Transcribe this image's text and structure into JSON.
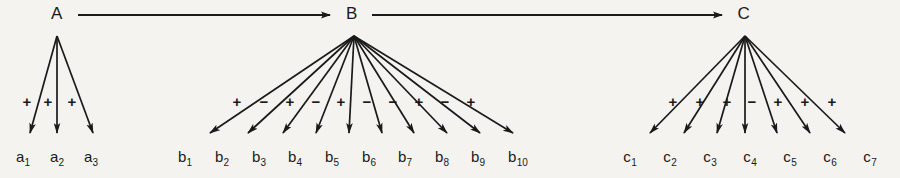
{
  "figure": {
    "background_color": "#f4f3ef",
    "ink_color": "#1a1a1a",
    "width": 900,
    "height": 178
  },
  "chain": {
    "arrow_glyph": "arrow-right",
    "nodes": [
      {
        "id": "A",
        "label": "A",
        "x": 57,
        "y": 14
      },
      {
        "id": "B",
        "label": "B",
        "x": 352,
        "y": 14
      },
      {
        "id": "C",
        "label": "C",
        "x": 744,
        "y": 14
      }
    ],
    "links": [
      {
        "from": "A",
        "to": "B",
        "x1": 78,
        "y1": 15,
        "x2": 330,
        "y2": 15
      },
      {
        "from": "B",
        "to": "C",
        "x1": 372,
        "y1": 15,
        "x2": 722,
        "y2": 15
      }
    ]
  },
  "groups": [
    {
      "id": "group-a",
      "parent": "A",
      "apex_x": 57,
      "apex_y": 36,
      "sign_y": 101,
      "tip_y": 133,
      "label_y": 158,
      "children": [
        {
          "label": "a",
          "index": "1",
          "sign": "+",
          "tip_x": 30,
          "label_x": 23,
          "sign_x": 27
        },
        {
          "label": "a",
          "index": "2",
          "sign": "+",
          "tip_x": 57,
          "label_x": 57,
          "sign_x": 48
        },
        {
          "label": "a",
          "index": "3",
          "sign": "+",
          "tip_x": 93,
          "label_x": 91,
          "sign_x": 72
        }
      ]
    },
    {
      "id": "group-b",
      "parent": "B",
      "apex_x": 354,
      "apex_y": 36,
      "sign_y": 101,
      "tip_y": 133,
      "label_y": 158,
      "children": [
        {
          "label": "b",
          "index": "1",
          "sign": "+",
          "tip_x": 210,
          "label_x": 185,
          "sign_x": 237
        },
        {
          "label": "b",
          "index": "2",
          "sign": "−",
          "tip_x": 248,
          "label_x": 222,
          "sign_x": 264
        },
        {
          "label": "b",
          "index": "3",
          "sign": "+",
          "tip_x": 283,
          "label_x": 259,
          "sign_x": 290
        },
        {
          "label": "b",
          "index": "4",
          "sign": "−",
          "tip_x": 316,
          "label_x": 295,
          "sign_x": 316
        },
        {
          "label": "b",
          "index": "5",
          "sign": "+",
          "tip_x": 349,
          "label_x": 332,
          "sign_x": 341
        },
        {
          "label": "b",
          "index": "6",
          "sign": "−",
          "tip_x": 382,
          "label_x": 369,
          "sign_x": 367
        },
        {
          "label": "b",
          "index": "7",
          "sign": "−",
          "tip_x": 414,
          "label_x": 405,
          "sign_x": 393
        },
        {
          "label": "b",
          "index": "8",
          "sign": "+",
          "tip_x": 447,
          "label_x": 442,
          "sign_x": 419
        },
        {
          "label": "b",
          "index": "9",
          "sign": "−",
          "tip_x": 480,
          "label_x": 478,
          "sign_x": 445
        },
        {
          "label": "b",
          "index": "10",
          "sign": "+",
          "tip_x": 513,
          "label_x": 518,
          "sign_x": 471
        }
      ]
    },
    {
      "id": "group-c",
      "parent": "C",
      "apex_x": 745,
      "apex_y": 36,
      "sign_y": 101,
      "tip_y": 133,
      "label_y": 158,
      "children": [
        {
          "label": "c",
          "index": "1",
          "sign": "+",
          "tip_x": 650,
          "label_x": 630,
          "sign_x": 673
        },
        {
          "label": "c",
          "index": "2",
          "sign": "+",
          "tip_x": 684,
          "label_x": 670,
          "sign_x": 700
        },
        {
          "label": "c",
          "index": "3",
          "sign": "+",
          "tip_x": 717,
          "label_x": 710,
          "sign_x": 727
        },
        {
          "label": "c",
          "index": "4",
          "sign": "−",
          "tip_x": 745,
          "label_x": 750,
          "sign_x": 752
        },
        {
          "label": "c",
          "index": "5",
          "sign": "+",
          "tip_x": 777,
          "label_x": 790,
          "sign_x": 778
        },
        {
          "label": "c",
          "index": "6",
          "sign": "+",
          "tip_x": 810,
          "label_x": 830,
          "sign_x": 805
        },
        {
          "label": "c",
          "index": "7",
          "sign": "+",
          "tip_x": 845,
          "label_x": 870,
          "sign_x": 832
        }
      ]
    }
  ]
}
